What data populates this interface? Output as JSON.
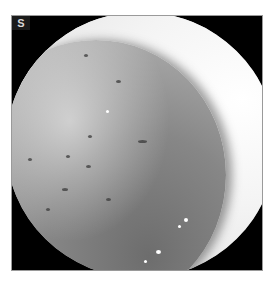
{
  "image": {
    "type": "grayscale endoscopic photograph",
    "label": "S",
    "colors": {
      "background": "#ffffff",
      "frame_corners": "#000000",
      "bright_wall": "#f2f2f2",
      "mucosa_mid": "#a0a0a0",
      "mucosa_dark": "#6d6d6d"
    }
  }
}
